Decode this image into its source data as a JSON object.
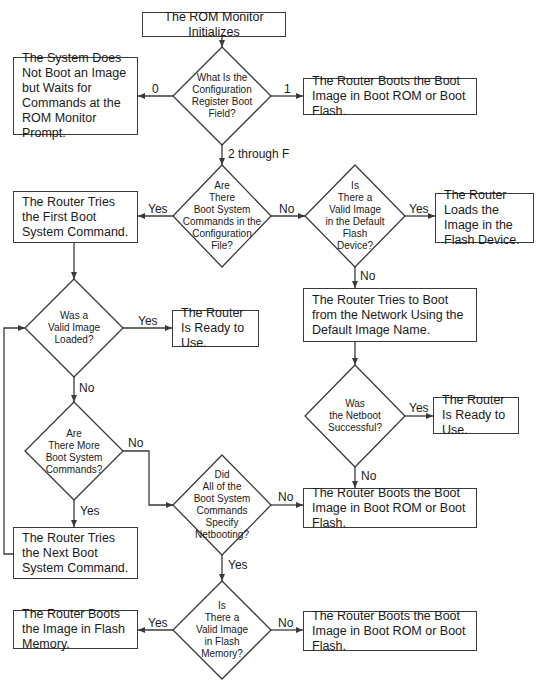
{
  "nodes": {
    "start": "The ROM Monitor Initializes",
    "q_config": "What Is the\nConfiguration\nRegister Boot\nField?",
    "no_boot": "The System Does Not Boot an Image but Waits for Commands at the ROM Monitor Prompt.",
    "boot_rom_1": "The Router Boots the Boot Image in Boot ROM or Boot Flash.",
    "q_boot_cmds": "Are\nThere\nBoot System\nCommands in the\nConfiguration\nFile?",
    "first_cmd": "The Router Tries the First Boot System Command.",
    "q_default_flash": "Is\nThere a\nValid Image\nin the Default\nFlash\nDevice?",
    "load_flash": "The Router Loads the Image in the Flash Device.",
    "net_boot": "The Router Tries to Boot from the Network Using the Default Image Name.",
    "q_valid_loaded": "Was a\nValid Image\nLoaded?",
    "ready_1": "The Router Is Ready to Use.",
    "q_netboot": "Was\nthe Netboot\nSuccessful?",
    "ready_2": "The Router Is Ready to Use.",
    "q_more_cmds": "Are\nThere More\nBoot System\nCommands?",
    "q_all_netboot": "Did\nAll of the\nBoot System\nCommands\nSpecify\nNetbooting?",
    "boot_rom_2": "The Router Boots the Boot Image in Boot ROM or Boot Flash.",
    "next_cmd": "The Router Tries the Next Boot System Command.",
    "q_flash_memory": "Is\nThere a\nValid Image\nin Flash\nMemory?",
    "boot_flash_mem": "The Router Boots the Image in Flash Memory.",
    "boot_rom_3": "The Router Boots the Boot Image in Boot ROM or Boot Flash."
  },
  "edge_labels": {
    "config_0": "0",
    "config_1": "1",
    "config_2f": "2 through F",
    "bootcmds_yes": "Yes",
    "bootcmds_no": "No",
    "defflash_yes": "Yes",
    "defflash_no": "No",
    "loaded_yes": "Yes",
    "loaded_no": "No",
    "netboot_yes": "Yes",
    "netboot_no": "No",
    "more_no": "No",
    "more_yes": "Yes",
    "allnet_no": "No",
    "allnet_yes": "Yes",
    "flashmem_yes": "Yes",
    "flashmem_no": "No"
  },
  "colors": {
    "line": "#3a3a3a",
    "background": "#ffffff",
    "text": "#1a1a1a"
  }
}
